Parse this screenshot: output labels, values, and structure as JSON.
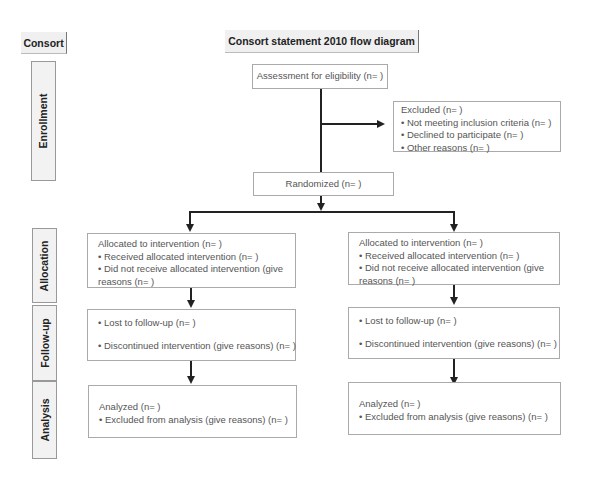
{
  "headers": {
    "consort": "Consort",
    "title": "Consort statement 2010 flow diagram"
  },
  "stages": {
    "enrollment": "Enrollment",
    "allocation": "Allocation",
    "follow_up": "Follow-up",
    "analysis": "Analysis"
  },
  "enrollment": {
    "assessment": "Assessment for eligibility (n= )",
    "excluded": {
      "title": "Excluded (n= )",
      "items": [
        "• Not meeting inclusion criteria (n= )",
        "• Declined to participate (n= )",
        "• Other reasons (n= )"
      ]
    },
    "randomized": "Randomized (n= )"
  },
  "arms": [
    {
      "allocation": {
        "title": "Allocated to intervention (n= )",
        "items": [
          "• Received allocated intervention (n= )",
          "• Did not receive allocated intervention (give",
          "reasons (n= )"
        ]
      },
      "follow_up": {
        "items": [
          "• Lost to follow-up (n= )",
          "• Discontinued intervention (give reasons) (n= )"
        ]
      },
      "analysis": {
        "title": "Analyzed (n= )",
        "items": [
          "• Excluded from analysis (give reasons) (n= )"
        ]
      }
    },
    {
      "allocation": {
        "title": "Allocated to intervention (n= )",
        "items": [
          "• Received allocated intervention (n= )",
          "• Did not receive allocated intervention (give",
          "reasons (n= )"
        ]
      },
      "follow_up": {
        "items": [
          "• Lost to follow-up (n= )",
          "• Discontinued intervention (give reasons) (n= )"
        ]
      },
      "analysis": {
        "title": "Analyzed (n= )",
        "items": [
          "• Excluded from analysis (give reasons) (n= )"
        ]
      }
    }
  ]
}
